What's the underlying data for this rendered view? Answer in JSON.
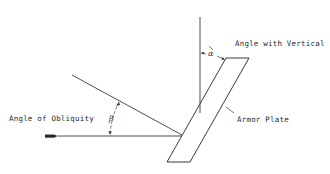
{
  "labels": {
    "angle_with_vertical": "Angle with Vertical",
    "angle_of_obliquity": "Angle of Obliquity",
    "armor_plate": "Armor Plate",
    "alpha": "α",
    "beta": "β"
  },
  "colors": {
    "line": "#3a3a3a",
    "background": "#ffffff"
  }
}
